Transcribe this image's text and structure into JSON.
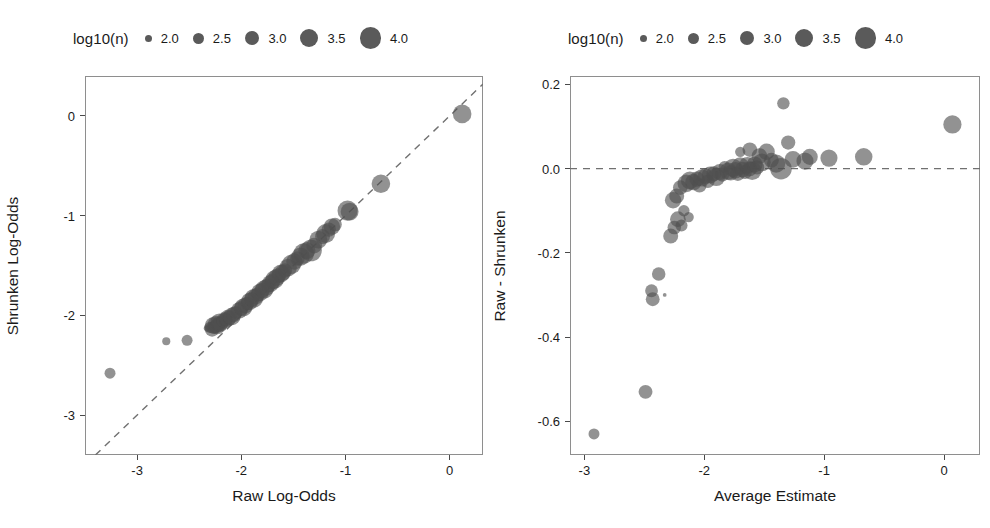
{
  "figure": {
    "panel_count": 2,
    "marker_color": "#4f4f4f",
    "marker_opacity": 0.62,
    "reference_line_color": "#707070",
    "frame_color": "#8e8e8e"
  },
  "legend": {
    "title": "log10(n)",
    "entries": [
      {
        "label": "2.0",
        "diameter": 7
      },
      {
        "label": "2.5",
        "diameter": 11
      },
      {
        "label": "3.0",
        "diameter": 14.5
      },
      {
        "label": "3.5",
        "diameter": 18
      },
      {
        "label": "4.0",
        "diameter": 21.5
      }
    ]
  },
  "chart_data": [
    {
      "type": "scatter",
      "panel": "left",
      "title": "",
      "xlabel": "Raw Log-Odds",
      "ylabel": "Shrunken Log-Odds",
      "xlim": [
        -3.5,
        0.32
      ],
      "ylim": [
        -3.4,
        0.4
      ],
      "xticks": [
        -3,
        -2,
        -1,
        0
      ],
      "xtick_labels": [
        "-3",
        "-2",
        "-1",
        "0"
      ],
      "yticks": [
        0,
        -1,
        -2,
        -3
      ],
      "ytick_labels": [
        "0",
        "-1",
        "-2",
        "-3"
      ],
      "grid": false,
      "legend_position": "top-center",
      "reference_line": {
        "type": "identity",
        "style": "dashed",
        "label": "y = x"
      },
      "size_encoding": "log10(n)",
      "points": [
        {
          "x": -3.26,
          "y": -2.58,
          "s": 2.55
        },
        {
          "x": -2.72,
          "y": -2.26,
          "s": 2.15
        },
        {
          "x": -2.52,
          "y": -2.25,
          "s": 2.55
        },
        {
          "x": -2.33,
          "y": -2.13,
          "s": 1.9
        },
        {
          "x": -2.3,
          "y": -2.12,
          "s": 2.6
        },
        {
          "x": -2.28,
          "y": -2.14,
          "s": 3.05
        },
        {
          "x": -2.27,
          "y": -2.1,
          "s": 3.3
        },
        {
          "x": -2.26,
          "y": -2.12,
          "s": 2.85
        },
        {
          "x": -2.24,
          "y": -2.09,
          "s": 3.4
        },
        {
          "x": -2.23,
          "y": -2.11,
          "s": 3.2
        },
        {
          "x": -2.22,
          "y": -2.08,
          "s": 2.9
        },
        {
          "x": -2.21,
          "y": -2.07,
          "s": 3.5
        },
        {
          "x": -2.2,
          "y": -2.09,
          "s": 3.1
        },
        {
          "x": -2.18,
          "y": -2.06,
          "s": 2.7
        },
        {
          "x": -2.16,
          "y": -2.05,
          "s": 3.25
        },
        {
          "x": -2.15,
          "y": -2.04,
          "s": 2.95
        },
        {
          "x": -2.13,
          "y": -2.03,
          "s": 3.35
        },
        {
          "x": -2.11,
          "y": -2.02,
          "s": 3.0
        },
        {
          "x": -2.09,
          "y": -2.01,
          "s": 3.45
        },
        {
          "x": -2.07,
          "y": -1.99,
          "s": 3.15
        },
        {
          "x": -2.05,
          "y": -1.97,
          "s": 2.8
        },
        {
          "x": -2.02,
          "y": -1.95,
          "s": 3.3
        },
        {
          "x": -2.0,
          "y": -1.93,
          "s": 3.05
        },
        {
          "x": -1.98,
          "y": -1.92,
          "s": 3.5
        },
        {
          "x": -1.96,
          "y": -1.9,
          "s": 3.2
        },
        {
          "x": -1.94,
          "y": -1.88,
          "s": 2.9
        },
        {
          "x": -1.92,
          "y": -1.86,
          "s": 3.4
        },
        {
          "x": -1.9,
          "y": -1.84,
          "s": 3.1
        },
        {
          "x": -1.88,
          "y": -1.83,
          "s": 3.6
        },
        {
          "x": -1.86,
          "y": -1.81,
          "s": 3.25
        },
        {
          "x": -1.84,
          "y": -1.79,
          "s": 3.0
        },
        {
          "x": -1.82,
          "y": -1.77,
          "s": 3.45
        },
        {
          "x": -1.8,
          "y": -1.75,
          "s": 3.15
        },
        {
          "x": -1.78,
          "y": -1.74,
          "s": 3.55
        },
        {
          "x": -1.76,
          "y": -1.72,
          "s": 3.3
        },
        {
          "x": -1.74,
          "y": -1.7,
          "s": 3.05
        },
        {
          "x": -1.72,
          "y": -1.68,
          "s": 3.4
        },
        {
          "x": -1.7,
          "y": -1.66,
          "s": 3.2
        },
        {
          "x": -1.68,
          "y": -1.64,
          "s": 3.6
        },
        {
          "x": -1.66,
          "y": -1.62,
          "s": 3.35
        },
        {
          "x": -1.64,
          "y": -1.6,
          "s": 3.1
        },
        {
          "x": -1.62,
          "y": -1.58,
          "s": 3.5
        },
        {
          "x": -1.6,
          "y": -1.57,
          "s": 3.25
        },
        {
          "x": -1.58,
          "y": -1.55,
          "s": 3.0
        },
        {
          "x": -1.55,
          "y": -1.52,
          "s": 3.45
        },
        {
          "x": -1.52,
          "y": -1.49,
          "s": 3.7
        },
        {
          "x": -1.49,
          "y": -1.46,
          "s": 3.3
        },
        {
          "x": -1.46,
          "y": -1.43,
          "s": 3.05
        },
        {
          "x": -1.43,
          "y": -1.41,
          "s": 3.55
        },
        {
          "x": -1.4,
          "y": -1.38,
          "s": 3.85
        },
        {
          "x": -1.37,
          "y": -1.35,
          "s": 3.4
        },
        {
          "x": -1.33,
          "y": -1.35,
          "s": 4.0
        },
        {
          "x": -1.3,
          "y": -1.3,
          "s": 3.2
        },
        {
          "x": -1.26,
          "y": -1.24,
          "s": 3.5
        },
        {
          "x": -1.22,
          "y": -1.21,
          "s": 3.1
        },
        {
          "x": -1.19,
          "y": -1.18,
          "s": 3.65
        },
        {
          "x": -1.16,
          "y": -1.14,
          "s": 3.0
        },
        {
          "x": -1.13,
          "y": -1.11,
          "s": 3.3
        },
        {
          "x": -1.1,
          "y": -1.09,
          "s": 2.9
        },
        {
          "x": -0.98,
          "y": -0.95,
          "s": 3.8
        },
        {
          "x": -0.96,
          "y": -0.96,
          "s": 3.5
        },
        {
          "x": -0.66,
          "y": -0.68,
          "s": 3.6
        },
        {
          "x": 0.12,
          "y": 0.02,
          "s": 3.6
        }
      ]
    },
    {
      "type": "scatter",
      "panel": "right",
      "title": "",
      "xlabel": "Average Estimate",
      "ylabel": "Raw - Shrunken",
      "xlim": [
        -3.12,
        0.3
      ],
      "ylim": [
        -0.68,
        0.22
      ],
      "xticks": [
        -3,
        -2,
        -1,
        0
      ],
      "xtick_labels": [
        "-3",
        "-2",
        "-1",
        "0"
      ],
      "yticks": [
        0.2,
        0.0,
        -0.2,
        -0.4,
        -0.6
      ],
      "ytick_labels": [
        "0.2",
        "0.0",
        "-0.2",
        "-0.4",
        "-0.6"
      ],
      "grid": false,
      "legend_position": "top-center",
      "reference_line": {
        "type": "hline",
        "value": 0.0,
        "style": "dashed"
      },
      "size_encoding": "log10(n)",
      "points": [
        {
          "x": -2.92,
          "y": -0.63,
          "s": 2.55
        },
        {
          "x": -2.49,
          "y": -0.53,
          "s": 2.95
        },
        {
          "x": -2.43,
          "y": -0.31,
          "s": 2.95
        },
        {
          "x": -2.44,
          "y": -0.29,
          "s": 2.8
        },
        {
          "x": -2.38,
          "y": -0.25,
          "s": 2.9
        },
        {
          "x": -2.33,
          "y": -0.3,
          "s": 1.55
        },
        {
          "x": -2.28,
          "y": -0.16,
          "s": 3.1
        },
        {
          "x": -2.25,
          "y": -0.14,
          "s": 2.9
        },
        {
          "x": -2.22,
          "y": -0.12,
          "s": 3.2
        },
        {
          "x": -2.19,
          "y": -0.135,
          "s": 2.7
        },
        {
          "x": -2.26,
          "y": -0.075,
          "s": 3.3
        },
        {
          "x": -2.23,
          "y": -0.065,
          "s": 3.1
        },
        {
          "x": -2.17,
          "y": -0.1,
          "s": 2.6
        },
        {
          "x": -2.13,
          "y": -0.115,
          "s": 2.45
        },
        {
          "x": -2.2,
          "y": -0.045,
          "s": 3.05
        },
        {
          "x": -2.15,
          "y": -0.035,
          "s": 3.45
        },
        {
          "x": -2.12,
          "y": -0.028,
          "s": 3.5
        },
        {
          "x": -2.09,
          "y": -0.032,
          "s": 3.3
        },
        {
          "x": -2.06,
          "y": -0.025,
          "s": 3.15
        },
        {
          "x": -2.04,
          "y": -0.04,
          "s": 3.0
        },
        {
          "x": -2.02,
          "y": -0.022,
          "s": 3.4
        },
        {
          "x": -1.99,
          "y": -0.018,
          "s": 3.2
        },
        {
          "x": -1.97,
          "y": -0.03,
          "s": 2.9
        },
        {
          "x": -1.95,
          "y": -0.015,
          "s": 3.35
        },
        {
          "x": -1.92,
          "y": -0.012,
          "s": 3.1
        },
        {
          "x": -1.9,
          "y": -0.02,
          "s": 3.5
        },
        {
          "x": -1.87,
          "y": -0.008,
          "s": 3.25
        },
        {
          "x": -1.85,
          "y": -0.014,
          "s": 3.0
        },
        {
          "x": -1.83,
          "y": 0.004,
          "s": 2.7
        },
        {
          "x": -1.8,
          "y": -0.006,
          "s": 3.4
        },
        {
          "x": -1.78,
          "y": -0.01,
          "s": 3.15
        },
        {
          "x": -1.76,
          "y": 0.002,
          "s": 3.55
        },
        {
          "x": -1.74,
          "y": -0.004,
          "s": 3.3
        },
        {
          "x": -1.72,
          "y": -0.012,
          "s": 3.05
        },
        {
          "x": -1.7,
          "y": 0.006,
          "s": 3.45
        },
        {
          "x": -1.68,
          "y": -0.002,
          "s": 3.2
        },
        {
          "x": -1.66,
          "y": -0.008,
          "s": 2.95
        },
        {
          "x": -1.64,
          "y": 0.008,
          "s": 3.35
        },
        {
          "x": -1.62,
          "y": 0.0,
          "s": 3.1
        },
        {
          "x": -1.6,
          "y": -0.005,
          "s": 3.6
        },
        {
          "x": -1.58,
          "y": 0.01,
          "s": 3.25
        },
        {
          "x": -1.56,
          "y": 0.003,
          "s": 3.0
        },
        {
          "x": -1.7,
          "y": 0.04,
          "s": 2.45
        },
        {
          "x": -1.62,
          "y": 0.045,
          "s": 3.05
        },
        {
          "x": -1.54,
          "y": 0.03,
          "s": 3.2
        },
        {
          "x": -1.52,
          "y": 0.015,
          "s": 3.5
        },
        {
          "x": -1.48,
          "y": 0.04,
          "s": 3.3
        },
        {
          "x": -1.44,
          "y": 0.02,
          "s": 3.1
        },
        {
          "x": -1.4,
          "y": 0.012,
          "s": 3.55
        },
        {
          "x": -1.36,
          "y": 0.0,
          "s": 4.0
        },
        {
          "x": -1.34,
          "y": 0.155,
          "s": 2.75
        },
        {
          "x": -1.3,
          "y": 0.062,
          "s": 3.0
        },
        {
          "x": -1.26,
          "y": 0.022,
          "s": 3.35
        },
        {
          "x": -1.16,
          "y": 0.018,
          "s": 3.4
        },
        {
          "x": -1.12,
          "y": 0.028,
          "s": 3.25
        },
        {
          "x": -0.96,
          "y": 0.025,
          "s": 3.4
        },
        {
          "x": -0.67,
          "y": 0.028,
          "s": 3.45
        },
        {
          "x": 0.07,
          "y": 0.105,
          "s": 3.55
        }
      ]
    }
  ]
}
